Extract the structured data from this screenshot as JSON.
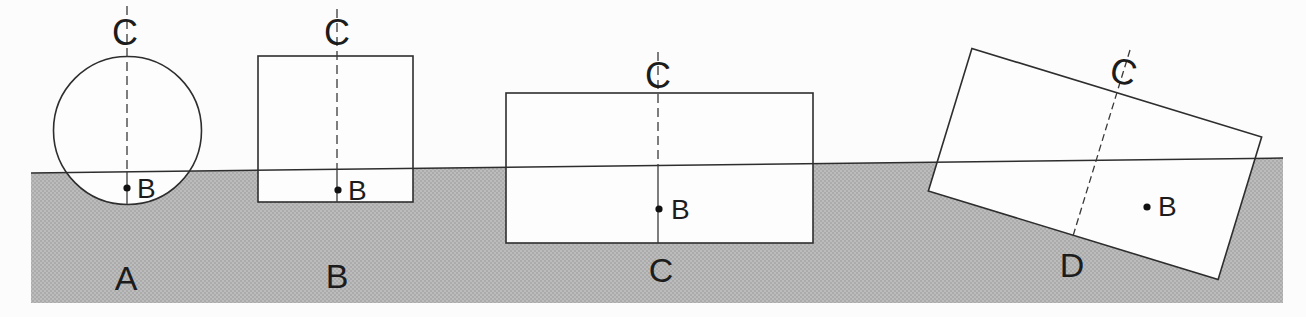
{
  "diagram": {
    "colors": {
      "background": "#fcfcfc",
      "water": "#b5b5b5",
      "water_dot": "#a3a3a3",
      "line": "#2e2e2e",
      "text": "#1c1c1c"
    },
    "shapes": [
      {
        "caption": "A",
        "form": "circle",
        "cg_label": "C",
        "cb_label": "B"
      },
      {
        "caption": "B",
        "form": "square",
        "cg_label": "C",
        "cb_label": "B"
      },
      {
        "caption": "C",
        "form": "rectangle",
        "cg_label": "C",
        "cb_label": "B"
      },
      {
        "caption": "D",
        "form": "tilted-rectangle",
        "cg_label": "C",
        "cb_label": "B"
      }
    ]
  }
}
